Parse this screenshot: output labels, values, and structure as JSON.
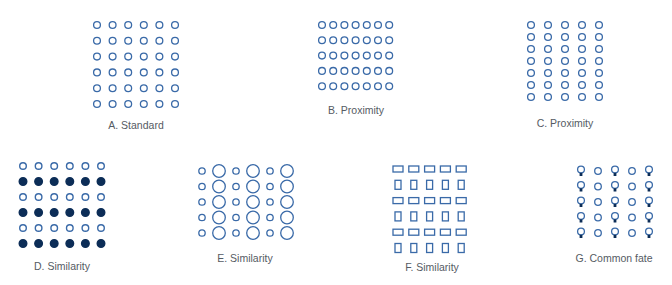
{
  "figure": {
    "colors": {
      "outline": "#3a6aa8",
      "fill": "#0c2d57"
    },
    "panels": [
      {
        "id": "A",
        "label": "A. Standard",
        "principle": "standard",
        "cols": 6,
        "rows": 6,
        "shape": "circle",
        "pattern": "uniform"
      },
      {
        "id": "B",
        "label": "B. Proximity",
        "principle": "proximity",
        "cols": 7,
        "rows": 5,
        "shape": "circle",
        "pattern": "rows-grouped"
      },
      {
        "id": "C",
        "label": "C. Proximity",
        "principle": "proximity",
        "cols": 5,
        "rows": 7,
        "shape": "circle",
        "pattern": "columns-grouped"
      },
      {
        "id": "D",
        "label": "D. Similarity",
        "principle": "similarity",
        "cols": 6,
        "rows": 6,
        "shape": "circle",
        "pattern": "alternating-rows-filled"
      },
      {
        "id": "E",
        "label": "E. Similarity",
        "principle": "similarity",
        "cols": 6,
        "rows": 5,
        "shape": "circle",
        "pattern": "alternating-columns-size"
      },
      {
        "id": "F",
        "label": "F. Similarity",
        "principle": "similarity",
        "cols": 5,
        "rows": 6,
        "shape": "rectangle",
        "pattern": "alternating-rows-orientation"
      },
      {
        "id": "G",
        "label": "G. Common fate",
        "principle": "common fate",
        "cols": 5,
        "rows": 5,
        "shape": "circle",
        "pattern": "alternating-columns-tail"
      }
    ]
  }
}
